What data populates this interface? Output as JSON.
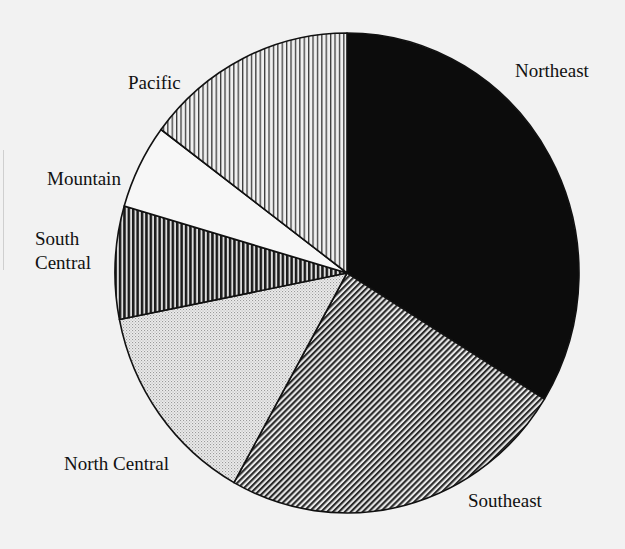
{
  "chart_data": {
    "type": "pie",
    "title": "",
    "start_angle_deg_clockwise_from_top": 0,
    "direction": "clockwise",
    "legend": "none (labels beside slices)",
    "slices": [
      {
        "label": "Northeast",
        "label_lines": [
          "Northeast"
        ],
        "value": 33.8,
        "fill": "solid-black"
      },
      {
        "label": "Southeast",
        "label_lines": [
          "Southeast"
        ],
        "value": 24.3,
        "fill": "diagonal-hatch"
      },
      {
        "label": "North Central",
        "label_lines": [
          "North Central"
        ],
        "value": 13.8,
        "fill": "dotted"
      },
      {
        "label": "South Central",
        "label_lines": [
          "South",
          "Central"
        ],
        "value": 7.6,
        "fill": "heavy-vertical-stripes"
      },
      {
        "label": "Mountain",
        "label_lines": [
          "Mountain"
        ],
        "value": 5.7,
        "fill": "white"
      },
      {
        "label": "Pacific",
        "label_lines": [
          "Pacific"
        ],
        "value": 14.8,
        "fill": "light-vertical-stripes"
      }
    ],
    "value_unit": "percent (estimated from slice angles)"
  },
  "colors": {
    "background": "#f2f2f2",
    "ink": "#111111",
    "paper": "#f7f7f7"
  }
}
